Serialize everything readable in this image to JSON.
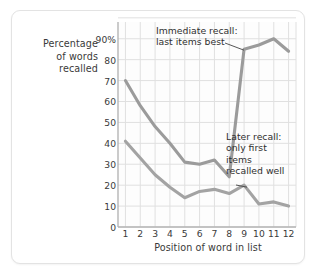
{
  "chart_data": {
    "type": "line",
    "title": "",
    "xlabel": "Position of word in list",
    "ylabel": "Percentage of words recalled",
    "x": [
      1,
      2,
      3,
      4,
      5,
      6,
      7,
      8,
      9,
      10,
      11,
      12
    ],
    "xtick_labels": [
      "1",
      "2",
      "3",
      "4",
      "5",
      "6",
      "7",
      "8",
      "9",
      "10",
      "11",
      "12"
    ],
    "ytick_labels": [
      "0",
      "10",
      "20",
      "30",
      "40",
      "50",
      "60",
      "70",
      "80",
      "90%"
    ],
    "ytick_values": [
      0,
      10,
      20,
      30,
      40,
      50,
      60,
      70,
      80,
      90
    ],
    "ylim": [
      0,
      98
    ],
    "xlim": [
      0.5,
      12.5
    ],
    "grid": true,
    "legend": "none",
    "series": [
      {
        "name": "Immediate recall",
        "color": "#9b9b9b",
        "values": [
          70,
          58,
          48,
          40,
          31,
          30,
          32,
          24,
          85,
          87,
          90,
          84
        ]
      },
      {
        "name": "Later recall",
        "color": "#a3a3a3",
        "values": [
          41,
          33,
          25,
          19,
          14,
          17,
          18,
          16,
          20,
          11,
          12,
          10
        ]
      }
    ],
    "annotations": [
      {
        "name": "immediate-recall-annotation",
        "lines": [
          "Immediate recall:",
          "last items best"
        ],
        "text": "Immediate recall:\nlast items best",
        "points_to_series": "Immediate recall",
        "points_to_x": 9
      },
      {
        "name": "later-recall-annotation",
        "lines": [
          "Later recall:",
          "only first",
          "items",
          "recalled well"
        ],
        "text": "Later recall:\nonly first\nitems\nrecalled well",
        "points_to_series": "Later recall",
        "points_to_x": 9
      }
    ],
    "colors": {
      "grid": "#e0e0e0",
      "axis": "#b5b5b5",
      "text": "#3a3a3a",
      "plot_background": "#fdfdfd",
      "frame_border": "#e3e3e3"
    }
  },
  "y_axis_title_lines": [
    "Percentage",
    "of words",
    "recalled"
  ]
}
